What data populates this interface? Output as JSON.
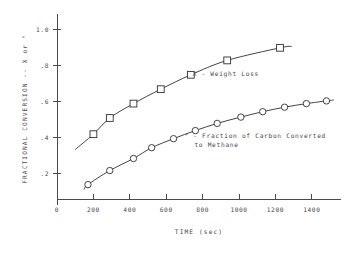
{
  "chart_data": {
    "type": "scatter",
    "title": "",
    "xlabel": "TIME (sec)",
    "ylabel": "FRACTIONAL CONVERSION -- X or °",
    "xlim": [
      0,
      1560
    ],
    "ylim": [
      0.06,
      1.06
    ],
    "xticks": [
      0,
      200,
      400,
      600,
      800,
      1000,
      1200,
      1400
    ],
    "xticklabels": [
      "0",
      "200",
      "400",
      "600",
      "800",
      "1000",
      "1200",
      "1400"
    ],
    "yticks": [
      0.2,
      0.4,
      0.6,
      0.8,
      1.0
    ],
    "yticklabels": [
      ".2",
      ".4",
      ".6",
      ".8",
      "1.0"
    ],
    "grid": false,
    "legend_position": "inside-right",
    "series": [
      {
        "name": "X - Weight Loss",
        "marker": "square",
        "points": [
          {
            "x": 200,
            "y": 0.42
          },
          {
            "x": 290,
            "y": 0.51
          },
          {
            "x": 420,
            "y": 0.59
          },
          {
            "x": 570,
            "y": 0.67
          },
          {
            "x": 735,
            "y": 0.75
          },
          {
            "x": 935,
            "y": 0.83
          },
          {
            "x": 1225,
            "y": 0.9
          }
        ],
        "curve_start": {
          "x": 100,
          "y": 0.335
        },
        "curve_end": {
          "x": 1290,
          "y": 0.908
        }
      },
      {
        "name": "° - Fraction of Carbon Converted to Methane",
        "marker": "circle",
        "points": [
          {
            "x": 170,
            "y": 0.14
          },
          {
            "x": 290,
            "y": 0.218
          },
          {
            "x": 420,
            "y": 0.285
          },
          {
            "x": 520,
            "y": 0.345
          },
          {
            "x": 640,
            "y": 0.395
          },
          {
            "x": 760,
            "y": 0.44
          },
          {
            "x": 880,
            "y": 0.48
          },
          {
            "x": 1010,
            "y": 0.515
          },
          {
            "x": 1130,
            "y": 0.545
          },
          {
            "x": 1250,
            "y": 0.57
          },
          {
            "x": 1370,
            "y": 0.59
          },
          {
            "x": 1480,
            "y": 0.605
          }
        ],
        "curve_start": {
          "x": 148,
          "y": 0.112
        },
        "curve_end": {
          "x": 1520,
          "y": 0.61
        }
      }
    ],
    "annotations": [
      {
        "id": "legend-weight-loss",
        "lines": [
          "X - Weight Loss"
        ],
        "x": 745,
        "y": 0.745
      },
      {
        "id": "legend-methane",
        "lines": [
          "° - Fraction of Carbon Converted",
          "to Methane"
        ],
        "x": 700,
        "y": 0.398
      }
    ]
  }
}
